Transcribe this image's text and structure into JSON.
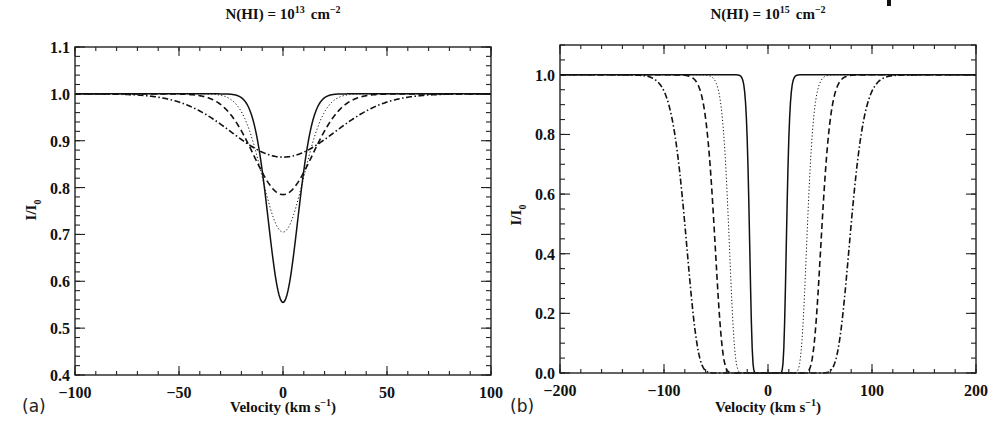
{
  "chart_data": [
    {
      "type": "line",
      "panel_label": "(a)",
      "title_prefix": "N(HI) = 10",
      "title_exp": "13",
      "title_unit": "cm",
      "title_unit_exp": "−2",
      "xlabel_prefix": "Velocity (km s",
      "xlabel_exp": "−1",
      "xlabel_suffix": ")",
      "ylabel": "I/I",
      "ylabel_sub": "0",
      "xlim": [
        -100,
        100
      ],
      "ylim": [
        0.4,
        1.1
      ],
      "xticks": [
        -100,
        -50,
        0,
        50,
        100
      ],
      "xtick_labels": [
        "−100",
        "−50",
        "0",
        "50",
        "100"
      ],
      "yticks": [
        0.4,
        0.5,
        0.6,
        0.7,
        0.8,
        0.9,
        1.0,
        1.1
      ],
      "ytick_labels": [
        "0.4",
        "0.5",
        "0.6",
        "0.7",
        "0.8",
        "0.9",
        "1.0",
        "1.1"
      ],
      "grid": false,
      "legend": "none",
      "series": [
        {
          "name": "solid",
          "style": "solid",
          "min_value": 0.555,
          "min_at": 0,
          "halfwidth_kms": 10
        },
        {
          "name": "dotted",
          "style": "dotted",
          "min_value": 0.705,
          "min_at": 0,
          "halfwidth_kms": 14
        },
        {
          "name": "dashed",
          "style": "dashed",
          "min_value": 0.785,
          "min_at": 0,
          "halfwidth_kms": 20
        },
        {
          "name": "dash-dot",
          "style": "dashdot",
          "min_value": 0.865,
          "min_at": 0,
          "halfwidth_kms": 35
        }
      ]
    },
    {
      "type": "line",
      "panel_label": "(b)",
      "title_prefix": "N(HI) = 10",
      "title_exp": "15",
      "title_unit": "cm",
      "title_unit_exp": "−2",
      "xlabel_prefix": "Velocity (km s",
      "xlabel_exp": "−1",
      "xlabel_suffix": ")",
      "ylabel": "I/I",
      "ylabel_sub": "0",
      "xlim": [
        -200,
        200
      ],
      "ylim": [
        0.0,
        1.1
      ],
      "xticks": [
        -200,
        -100,
        0,
        100,
        200
      ],
      "xtick_labels": [
        "−200",
        "−100",
        "0",
        "100",
        "200"
      ],
      "yticks": [
        0.0,
        0.2,
        0.4,
        0.6,
        0.8,
        1.0
      ],
      "ytick_labels": [
        "0.0",
        "0.2",
        "0.4",
        "0.6",
        "0.8",
        "1.0"
      ],
      "grid": false,
      "legend": "none",
      "series": [
        {
          "name": "solid",
          "style": "solid",
          "min_value": 0.0,
          "half_depth_velocity": 18,
          "edge_velocity": 25
        },
        {
          "name": "dotted",
          "style": "dotted",
          "min_value": 0.0,
          "half_depth_velocity": 38,
          "edge_velocity": 55
        },
        {
          "name": "dashed",
          "style": "dashed",
          "min_value": 0.0,
          "half_depth_velocity": 52,
          "edge_velocity": 80
        },
        {
          "name": "dash-dot",
          "style": "dashdot",
          "min_value": 0.0,
          "half_depth_velocity": 80,
          "edge_velocity": 115
        }
      ]
    }
  ]
}
